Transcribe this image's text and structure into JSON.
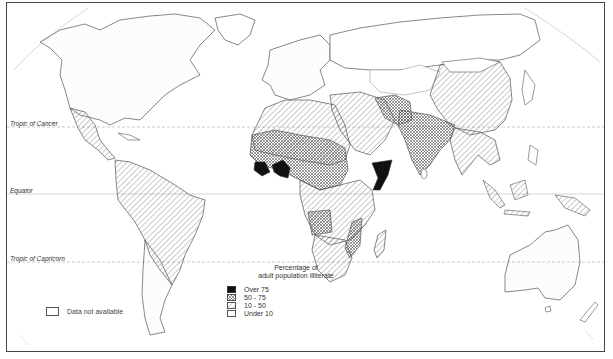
{
  "map": {
    "subject": "Percentage of adult population illiterate",
    "projection_lines": [
      {
        "name": "Tropic of Cancer",
        "y": 127
      },
      {
        "name": "Equator",
        "y": 194
      },
      {
        "name": "Tropic of Capricorn",
        "y": 262
      }
    ],
    "colors": {
      "frame": "#444444",
      "outline": "#555555",
      "over_75": "#111111",
      "pattern_ink": "#555555",
      "guide_line": "#aaaaaa"
    }
  },
  "legend": {
    "title_line1": "Percentage of",
    "title_line2": "adult population illiterate",
    "items": [
      {
        "label": "Over 75",
        "pattern": "solid-black"
      },
      {
        "label": "50 - 75",
        "pattern": "crosshatch"
      },
      {
        "label": "10 - 50",
        "pattern": "diagonal-hatch"
      },
      {
        "label": "Under 10",
        "pattern": "dotted"
      }
    ],
    "no_data_label": "Data not available"
  }
}
